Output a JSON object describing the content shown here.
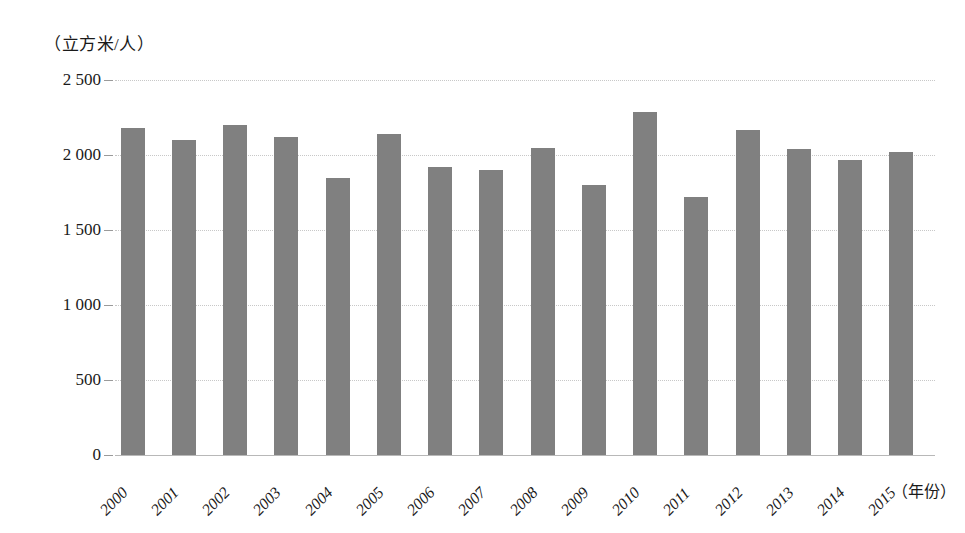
{
  "chart_data": {
    "type": "bar",
    "title": "",
    "subtitle": "",
    "xlabel": "（年份）",
    "ylabel": "（立方米/人）",
    "categories": [
      "2000",
      "2001",
      "2002",
      "2003",
      "2004",
      "2005",
      "2006",
      "2007",
      "2008",
      "2009",
      "2010",
      "2011",
      "2012",
      "2013",
      "2014",
      "2015"
    ],
    "values": [
      2180,
      2100,
      2200,
      2120,
      1850,
      2140,
      1920,
      1900,
      2050,
      1800,
      2290,
      1720,
      2170,
      2040,
      1970,
      2020
    ],
    "ylim": [
      0,
      2500
    ],
    "ytick_values": [
      0,
      500,
      1000,
      1500,
      2000,
      2500
    ],
    "ytick_labels": [
      "0",
      "500",
      "1 000",
      "1 500",
      "2 000",
      "2 500"
    ],
    "grid": true,
    "legend": false,
    "bar_color": "#808080",
    "gridline_color": "#c8c8c8",
    "axis_color": "#b8b8b8",
    "text_color": "#1a1a1a",
    "background": "#ffffff",
    "series": [
      {
        "name": "人均水资源量",
        "values": [
          2180,
          2100,
          2200,
          2120,
          1850,
          2140,
          1920,
          1900,
          2050,
          1800,
          2290,
          1720,
          2170,
          2040,
          1970,
          2020
        ]
      }
    ]
  }
}
